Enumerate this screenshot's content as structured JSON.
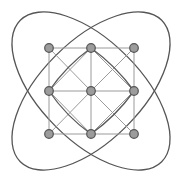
{
  "diagram": {
    "type": "graph",
    "colors": {
      "background": "#ffffff",
      "node_fill": "#9c9c9c",
      "node_stroke": "#555555",
      "light_edge": "#9a9a9a",
      "dark_edge": "#5a5a5a",
      "ellipse": "#555555"
    },
    "nodes": [
      {
        "id": "n00",
        "x": 49,
        "y": 48
      },
      {
        "id": "n01",
        "x": 91,
        "y": 48
      },
      {
        "id": "n02",
        "x": 134,
        "y": 48
      },
      {
        "id": "n10",
        "x": 49,
        "y": 91
      },
      {
        "id": "n11",
        "x": 91,
        "y": 91
      },
      {
        "id": "n12",
        "x": 134,
        "y": 91
      },
      {
        "id": "n20",
        "x": 49,
        "y": 134
      },
      {
        "id": "n21",
        "x": 91,
        "y": 134
      },
      {
        "id": "n22",
        "x": 134,
        "y": 134
      }
    ],
    "ellipses": [
      {
        "id": "ellipse-diag-down",
        "cx": 91,
        "cy": 91,
        "rx": 100,
        "ry": 50,
        "rotation": 45
      },
      {
        "id": "ellipse-diag-up",
        "cx": 91,
        "cy": 91,
        "rx": 100,
        "ry": 50,
        "rotation": -45
      }
    ]
  }
}
